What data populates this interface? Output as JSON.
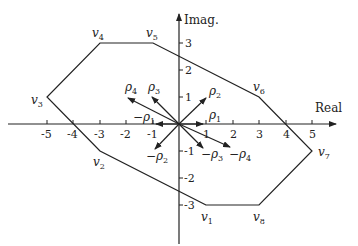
{
  "axes": {
    "x_label": "Real",
    "y_label": "Imag.",
    "x_ticks": [
      "-5",
      "-4",
      "-3",
      "-2",
      "-1",
      "1",
      "2",
      "3",
      "4",
      "5"
    ],
    "y_ticks": [
      "3",
      "2",
      "1",
      "-1",
      "-2",
      "-3"
    ]
  },
  "polygon": {
    "vertices": [
      {
        "name": "v",
        "sub": "1",
        "x": 1,
        "y": -3
      },
      {
        "name": "v",
        "sub": "2",
        "x": -3,
        "y": -1
      },
      {
        "name": "v",
        "sub": "3",
        "x": -5,
        "y": 1
      },
      {
        "name": "v",
        "sub": "4",
        "x": -3,
        "y": 3
      },
      {
        "name": "v",
        "sub": "5",
        "x": -1,
        "y": 3
      },
      {
        "name": "v",
        "sub": "6",
        "x": 3,
        "y": 1
      },
      {
        "name": "v",
        "sub": "7",
        "x": 5,
        "y": -1
      },
      {
        "name": "v",
        "sub": "8",
        "x": 3,
        "y": -3
      }
    ]
  },
  "vectors": [
    {
      "label": "ρ",
      "sub": "1",
      "sign": "",
      "x": 0.9,
      "y": 0
    },
    {
      "label": "ρ",
      "sub": "2",
      "sign": "",
      "x": 1,
      "y": 1
    },
    {
      "label": "ρ",
      "sub": "3",
      "sign": "",
      "x": -1,
      "y": 1
    },
    {
      "label": "ρ",
      "sub": "4",
      "sign": "",
      "x": -1.9,
      "y": 1
    },
    {
      "label": "ρ",
      "sub": "1",
      "sign": "−",
      "x": -0.9,
      "y": 0
    },
    {
      "label": "ρ",
      "sub": "2",
      "sign": "−",
      "x": -0.9,
      "y": -1
    },
    {
      "label": "ρ",
      "sub": "3",
      "sign": "−",
      "x": 0.9,
      "y": -0.9
    },
    {
      "label": "ρ",
      "sub": "4",
      "sign": "−",
      "x": 2,
      "y": -0.9
    }
  ],
  "labels": {
    "v1": {
      "main": "v",
      "sub": "1"
    },
    "v2": {
      "main": "v",
      "sub": "2"
    },
    "v3": {
      "main": "v",
      "sub": "3"
    },
    "v4": {
      "main": "v",
      "sub": "4"
    },
    "v5": {
      "main": "v",
      "sub": "5"
    },
    "v6": {
      "main": "v",
      "sub": "6"
    },
    "v7": {
      "main": "v",
      "sub": "7"
    },
    "v8": {
      "main": "v",
      "sub": "8"
    },
    "rho1": {
      "main": "ρ",
      "sub": "1"
    },
    "rho2": {
      "main": "ρ",
      "sub": "2"
    },
    "rho3": {
      "main": "ρ",
      "sub": "3"
    },
    "rho4": {
      "main": "ρ",
      "sub": "4"
    },
    "neg_rho1": {
      "main": "−ρ",
      "sub": "1"
    },
    "neg_rho2": {
      "main": "−ρ",
      "sub": "2"
    },
    "neg_rho3": {
      "main": "−ρ",
      "sub": "3"
    },
    "neg_rho4": {
      "main": "−ρ",
      "sub": "4"
    }
  },
  "colors": {
    "stroke": "#222222",
    "background": "#ffffff"
  }
}
